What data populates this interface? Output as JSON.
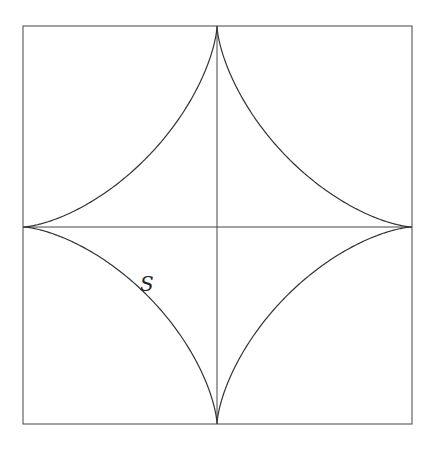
{
  "figure": {
    "curve": "astroid",
    "label": "S",
    "label_position": {
      "x": 146,
      "y": 285
    },
    "frame": {
      "left": 23,
      "top": 26,
      "right": 412,
      "bottom": 424
    },
    "center": {
      "x": 217,
      "y": 227
    },
    "line_color": "#333333"
  }
}
